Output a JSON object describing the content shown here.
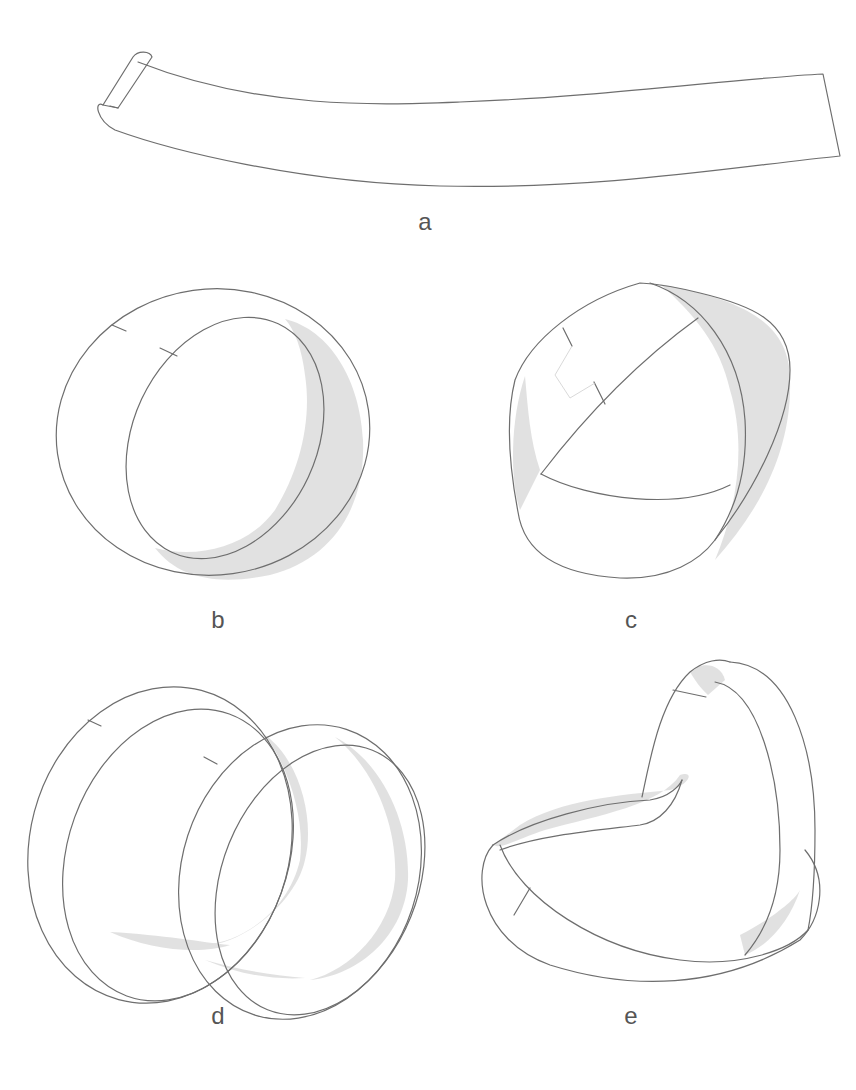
{
  "figure": {
    "panels": [
      {
        "id": "a",
        "label": "a",
        "description": "flat paper strip with slightly curled left end"
      },
      {
        "id": "b",
        "label": "b",
        "description": "strip joined into a cylindrical loop"
      },
      {
        "id": "c",
        "label": "c",
        "description": "strip joined with a half twist (Möbius band)"
      },
      {
        "id": "d",
        "label": "d",
        "description": "strip joined with two loops (double band)"
      },
      {
        "id": "e",
        "label": "e",
        "description": "twisted band in heart-like shape"
      }
    ],
    "colors": {
      "line": "#6e6e6e",
      "shade": "#dcdcdc",
      "label": "#555555",
      "background": "#ffffff"
    }
  }
}
